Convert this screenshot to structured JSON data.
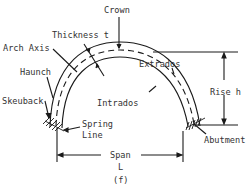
{
  "figure": {
    "caption": "(f)",
    "labels": {
      "crown": "Crown",
      "thickness": "Thickness t",
      "arch_axis": "Arch Axis",
      "extrados": "Extrados",
      "haunch": "Haunch",
      "intrados": "Intrados",
      "rise": "Rise h",
      "skewback": "Skeuback",
      "spring_line_1": "Spring",
      "spring_line_2": "Line",
      "abutment": "Abutment",
      "span": "Span",
      "span_symbol": "L"
    },
    "colors": {
      "line": "#1a1a1a",
      "text": "#333333",
      "background": "#ffffff"
    }
  }
}
